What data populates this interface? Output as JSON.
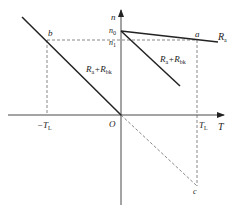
{
  "diagram": {
    "type": "mechanical-characteristic",
    "axes": {
      "vertical_label": "n",
      "horizontal_label": "T",
      "origin_label": "O"
    },
    "ticks": {
      "n0": {
        "base": "n",
        "sub": "0"
      },
      "n1": {
        "base": "n",
        "sub": "1"
      },
      "neg_TL": {
        "base": "−T",
        "sub": "L"
      },
      "pos_TL": {
        "base": "T",
        "sub": "L"
      }
    },
    "points": {
      "a": "a",
      "b": "b",
      "c": "c"
    },
    "curves": {
      "Ra": {
        "base": "R",
        "sub": "a"
      },
      "Ra_Rbk_upper": {
        "base": "R",
        "sub": "a",
        "plus": "+R",
        "sub2": "bk"
      },
      "Ra_Rbk_right": {
        "base": "R",
        "sub": "a",
        "plus": "+R",
        "sub2": "bk"
      }
    },
    "colors": {
      "line": "#222222",
      "dashed": "#555555",
      "background": "#ffffff"
    }
  }
}
